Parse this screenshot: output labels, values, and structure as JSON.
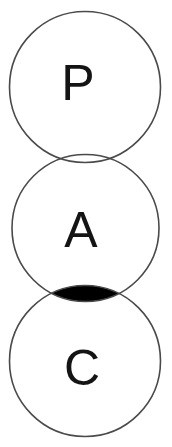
{
  "diagram": {
    "type": "venn-diagram",
    "title": "",
    "background_color": "#ffffff",
    "stroke_color": "#4a4a4a",
    "label_color": "#141414",
    "intersection_fill_color": "#000000",
    "circles": [
      {
        "id": "circle-p",
        "label": "P",
        "cx": 85,
        "cy": 87,
        "r": 75.5,
        "fill": "none"
      },
      {
        "id": "circle-a",
        "label": "A",
        "cx": 85.5,
        "cy": 228,
        "r": 73.5,
        "fill": "none"
      },
      {
        "id": "circle-c",
        "label": "C",
        "cx": 85,
        "cy": 361,
        "r": 75.5,
        "fill": "none"
      }
    ],
    "intersections": [
      {
        "id": "intersection-a-c",
        "between": [
          "A",
          "C"
        ],
        "shaded": true,
        "fill": "#000000",
        "label": "",
        "left_tip_x": 43,
        "right_tip_x": 129,
        "top_y": 285,
        "bottom_y": 301,
        "center_y": 296
      },
      {
        "id": "intersection-p-a",
        "between": [
          "P",
          "A"
        ],
        "shaded": false,
        "fill": "none",
        "label": "",
        "tangent_y": 162
      }
    ]
  }
}
